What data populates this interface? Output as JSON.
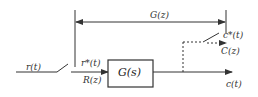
{
  "diagram": {
    "type": "sampled-data block diagram",
    "labels": {
      "input_signal": "r(t)",
      "sampled_input": "r*(t)",
      "input_z": "R(z)",
      "block": "G(s)",
      "pulse_transfer": "G(z)",
      "sampled_output": "c*(t)",
      "output_z": "C(z)",
      "output_signal": "c(t)"
    },
    "colors": {
      "line": "#333333",
      "background": "#ffffff"
    }
  }
}
